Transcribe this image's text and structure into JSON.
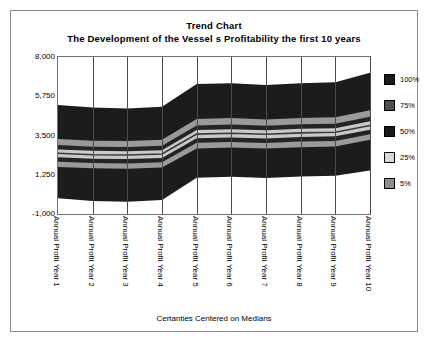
{
  "chart_data": {
    "type": "area",
    "title": "Trend Chart",
    "subtitle": "The Development of the Vessel s Profitability the first 10 years",
    "xlabel": "Certanties Centered  on Medians",
    "ylabel": "",
    "ylim": [
      -1000,
      8000
    ],
    "yticks": [
      8000,
      5750,
      3500,
      1250,
      -1000
    ],
    "ytick_labels": [
      "8,000",
      "5,750",
      "3,500",
      "1,250",
      "-1,000"
    ],
    "grid": true,
    "legend_position": "right",
    "categories": [
      "Annual Profit Year 1",
      "Annual Profit Year 2",
      "Annual Profit Year 3",
      "Annual Profit Year 4",
      "Annual Profit Year 5",
      "Annual Profit Year 6",
      "Annual Profit Year 7",
      "Annual Profit Year 8",
      "Annual Profit Year 9",
      "Annual Profit Year 10"
    ],
    "legend": [
      {
        "label": "100%",
        "color": "#1a1a1a"
      },
      {
        "label": "75%",
        "color": "#4f4f4f"
      },
      {
        "label": "50%",
        "color": "#1a1a1a"
      },
      {
        "label": "25%",
        "color": "#d8d8d8"
      },
      {
        "label": "5%",
        "color": "#8d8d8d"
      }
    ],
    "series": [
      {
        "name": "100% upper",
        "values": [
          5250,
          5100,
          5050,
          5150,
          6450,
          6500,
          6400,
          6500,
          6550,
          7100
        ]
      },
      {
        "name": "75% upper",
        "values": [
          3300,
          3200,
          3180,
          3260,
          4450,
          4500,
          4420,
          4500,
          4540,
          4950
        ]
      },
      {
        "name": "50% upper",
        "values": [
          2950,
          2860,
          2840,
          2910,
          4080,
          4130,
          4060,
          4140,
          4180,
          4580
        ]
      },
      {
        "name": "25% upper",
        "values": [
          2700,
          2620,
          2600,
          2660,
          3810,
          3860,
          3800,
          3880,
          3920,
          4310
        ]
      },
      {
        "name": "median",
        "values": [
          2480,
          2400,
          2380,
          2440,
          3580,
          3630,
          3570,
          3650,
          3690,
          4070
        ]
      },
      {
        "name": "25% lower",
        "values": [
          2250,
          2170,
          2150,
          2210,
          3340,
          3390,
          3330,
          3410,
          3450,
          3830
        ]
      },
      {
        "name": "50% lower",
        "values": [
          2000,
          1920,
          1900,
          1960,
          3080,
          3130,
          3070,
          3150,
          3190,
          3570
        ]
      },
      {
        "name": "75% lower",
        "values": [
          1700,
          1620,
          1600,
          1660,
          2760,
          2810,
          2750,
          2830,
          2870,
          3250
        ]
      },
      {
        "name": "100% lower",
        "values": [
          -100,
          -250,
          -300,
          -200,
          1080,
          1130,
          1070,
          1150,
          1190,
          1500
        ]
      }
    ]
  }
}
